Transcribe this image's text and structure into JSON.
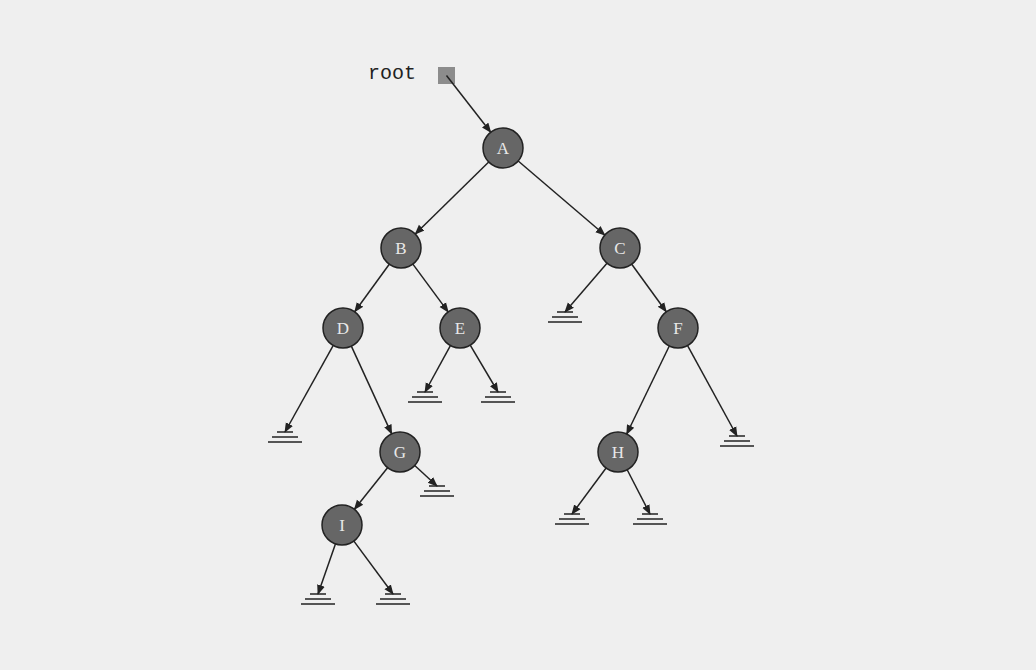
{
  "diagram": {
    "root_pointer": {
      "label": "root",
      "x": 438,
      "y": 67,
      "size": 17
    },
    "colors": {
      "node_fill": "#666666",
      "node_stroke": "#222222",
      "node_text": "#e8e8e8",
      "edge": "#222222",
      "root_box": "#8c8c8c",
      "background": "#efefef"
    },
    "node_radius": 20,
    "nodes": [
      {
        "id": "A",
        "label": "A",
        "x": 503,
        "y": 148
      },
      {
        "id": "B",
        "label": "B",
        "x": 401,
        "y": 248
      },
      {
        "id": "C",
        "label": "C",
        "x": 620,
        "y": 248
      },
      {
        "id": "D",
        "label": "D",
        "x": 343,
        "y": 328
      },
      {
        "id": "E",
        "label": "E",
        "x": 460,
        "y": 328
      },
      {
        "id": "F",
        "label": "F",
        "x": 678,
        "y": 328
      },
      {
        "id": "G",
        "label": "G",
        "x": 400,
        "y": 452
      },
      {
        "id": "H",
        "label": "H",
        "x": 618,
        "y": 452
      },
      {
        "id": "I",
        "label": "I",
        "x": 342,
        "y": 525
      }
    ],
    "nulls": [
      {
        "id": "C_left",
        "x": 565,
        "y": 312
      },
      {
        "id": "D_left",
        "x": 285,
        "y": 432
      },
      {
        "id": "E_left",
        "x": 425,
        "y": 392
      },
      {
        "id": "E_right",
        "x": 498,
        "y": 392
      },
      {
        "id": "F_right",
        "x": 737,
        "y": 436
      },
      {
        "id": "G_right",
        "x": 437,
        "y": 486
      },
      {
        "id": "H_left",
        "x": 572,
        "y": 514
      },
      {
        "id": "H_right",
        "x": 650,
        "y": 514
      },
      {
        "id": "I_left",
        "x": 318,
        "y": 594
      },
      {
        "id": "I_right",
        "x": 393,
        "y": 594
      }
    ],
    "edges": [
      {
        "from": "A",
        "to": "B"
      },
      {
        "from": "A",
        "to": "C"
      },
      {
        "from": "B",
        "to": "D"
      },
      {
        "from": "B",
        "to": "E"
      },
      {
        "from": "C",
        "to": "C_left"
      },
      {
        "from": "C",
        "to": "F"
      },
      {
        "from": "D",
        "to": "D_left"
      },
      {
        "from": "D",
        "to": "G"
      },
      {
        "from": "E",
        "to": "E_left"
      },
      {
        "from": "E",
        "to": "E_right"
      },
      {
        "from": "F",
        "to": "H"
      },
      {
        "from": "F",
        "to": "F_right"
      },
      {
        "from": "G",
        "to": "I"
      },
      {
        "from": "G",
        "to": "G_right"
      },
      {
        "from": "H",
        "to": "H_left"
      },
      {
        "from": "H",
        "to": "H_right"
      },
      {
        "from": "I",
        "to": "I_left"
      },
      {
        "from": "I",
        "to": "I_right"
      }
    ]
  }
}
